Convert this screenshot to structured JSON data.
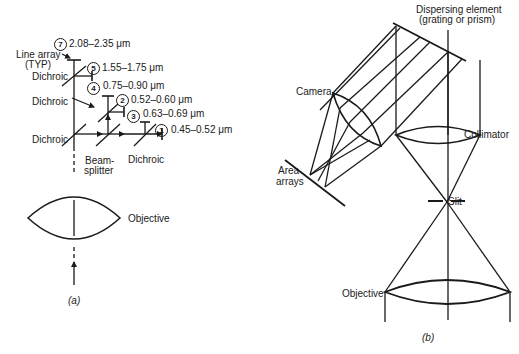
{
  "figure_a": {
    "caption": "(a)",
    "labels": {
      "line_array": "Line array",
      "line_array_typ": "(TYP)",
      "dichroic_1": "Dichroic",
      "dichroic_2": "Dichroic",
      "dichroic_3": "Dichroic",
      "dichroic_4": "Dichroic",
      "beamsplitter_1": "Beam-",
      "beamsplitter_2": "splitter",
      "objective": "Objective"
    },
    "bands": [
      {
        "id": "7",
        "range": "2.08–2.35 μm"
      },
      {
        "id": "5",
        "range": "1.55–1.75 μm"
      },
      {
        "id": "4",
        "range": "0.75–0.90 μm"
      },
      {
        "id": "2",
        "range": "0.52–0.60 μm"
      },
      {
        "id": "3",
        "range": "0.63–0.69 μm"
      },
      {
        "id": "1",
        "range": "0.45–0.52 μm"
      }
    ]
  },
  "figure_b": {
    "caption": "(b)",
    "labels": {
      "dispersing_1": "Dispersing element",
      "dispersing_2": "(grating or prism)",
      "camera": "Camera",
      "collimator": "Collimator",
      "area_1": "Area",
      "area_2": "arrays",
      "slit": "Slit",
      "objective": "Objective"
    }
  }
}
